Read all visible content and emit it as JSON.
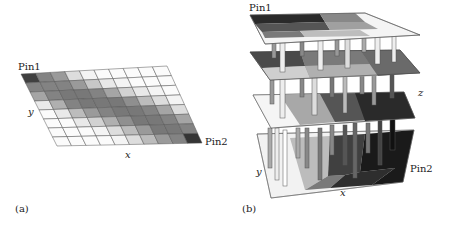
{
  "figure": {
    "panel_a": {
      "caption": "(a)",
      "pin1_label": "Pin1",
      "pin2_label": "Pin2",
      "x_axis_label": "x",
      "y_axis_label": "y",
      "grid": {
        "cols": 10,
        "rows": 8,
        "shades": [
          [
            0.85,
            0.55,
            0.45,
            0.15,
            0.05,
            0.02,
            0.02,
            0.02,
            0.02,
            0.02
          ],
          [
            0.55,
            0.55,
            0.55,
            0.45,
            0.25,
            0.1,
            0.05,
            0.02,
            0.02,
            0.02
          ],
          [
            0.4,
            0.55,
            0.6,
            0.6,
            0.55,
            0.4,
            0.2,
            0.1,
            0.05,
            0.02
          ],
          [
            0.1,
            0.35,
            0.55,
            0.6,
            0.6,
            0.6,
            0.5,
            0.3,
            0.15,
            0.05
          ],
          [
            0.02,
            0.1,
            0.3,
            0.45,
            0.55,
            0.6,
            0.6,
            0.55,
            0.4,
            0.15
          ],
          [
            0.02,
            0.02,
            0.1,
            0.2,
            0.35,
            0.5,
            0.6,
            0.6,
            0.55,
            0.4
          ],
          [
            0.02,
            0.02,
            0.02,
            0.05,
            0.15,
            0.3,
            0.45,
            0.6,
            0.6,
            0.55
          ],
          [
            0.02,
            0.02,
            0.02,
            0.02,
            0.05,
            0.15,
            0.3,
            0.45,
            0.55,
            0.9
          ]
        ]
      }
    },
    "panel_b": {
      "caption": "(b)",
      "pin1_label": "Pin1",
      "pin2_label": "Pin2",
      "x_axis_label": "x",
      "y_axis_label": "y",
      "z_axis_label": "z",
      "layers": 4
    }
  }
}
